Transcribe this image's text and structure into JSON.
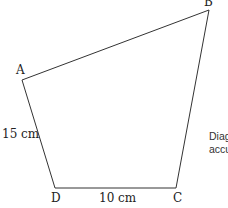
{
  "diagram": {
    "vertices": {
      "A": {
        "label": "A",
        "x": 22,
        "y": 80
      },
      "B": {
        "label": "B",
        "x": 209,
        "y": 10
      },
      "C": {
        "label": "C",
        "x": 176,
        "y": 188
      },
      "D": {
        "label": "D",
        "x": 55,
        "y": 188
      }
    },
    "side_labels": {
      "AD": "15 cm",
      "DC": "10 cm"
    },
    "note_lines": [
      "Diag",
      "accu"
    ],
    "line_color": "#333333"
  }
}
